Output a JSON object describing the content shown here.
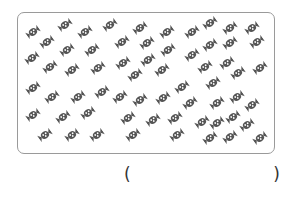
{
  "worksheet": {
    "icon_name": "wrapped-candy-icon",
    "candy_color": "#555555",
    "border_color": "#9a9a9a",
    "candy_count_depicted": 63,
    "candies": [
      [
        33,
        32
      ],
      [
        65,
        25
      ],
      [
        85,
        32
      ],
      [
        110,
        25
      ],
      [
        140,
        28
      ],
      [
        167,
        32
      ],
      [
        192,
        32
      ],
      [
        210,
        23
      ],
      [
        230,
        28
      ],
      [
        252,
        28
      ],
      [
        47,
        42
      ],
      [
        122,
        42
      ],
      [
        147,
        43
      ],
      [
        168,
        50
      ],
      [
        210,
        45
      ],
      [
        230,
        43
      ],
      [
        257,
        42
      ],
      [
        32,
        58
      ],
      [
        67,
        50
      ],
      [
        92,
        50
      ],
      [
        192,
        55
      ],
      [
        50,
        67
      ],
      [
        72,
        70
      ],
      [
        98,
        68
      ],
      [
        123,
        63
      ],
      [
        148,
        60
      ],
      [
        135,
        75
      ],
      [
        162,
        70
      ],
      [
        205,
        67
      ],
      [
        227,
        63
      ],
      [
        238,
        73
      ],
      [
        260,
        68
      ],
      [
        33,
        88
      ],
      [
        213,
        83
      ],
      [
        182,
        87
      ],
      [
        52,
        97
      ],
      [
        78,
        97
      ],
      [
        102,
        92
      ],
      [
        120,
        97
      ],
      [
        140,
        100
      ],
      [
        163,
        98
      ],
      [
        190,
        103
      ],
      [
        217,
        103
      ],
      [
        237,
        97
      ],
      [
        252,
        105
      ],
      [
        33,
        115
      ],
      [
        63,
        117
      ],
      [
        88,
        113
      ],
      [
        128,
        118
      ],
      [
        153,
        120
      ],
      [
        175,
        118
      ],
      [
        202,
        122
      ],
      [
        217,
        123
      ],
      [
        233,
        117
      ],
      [
        247,
        125
      ],
      [
        45,
        135
      ],
      [
        72,
        135
      ],
      [
        97,
        135
      ],
      [
        133,
        135
      ],
      [
        177,
        135
      ],
      [
        210,
        138
      ],
      [
        230,
        137
      ],
      [
        260,
        138
      ]
    ]
  },
  "answer": {
    "open_paren": "(",
    "close_paren": ")",
    "value": ""
  }
}
